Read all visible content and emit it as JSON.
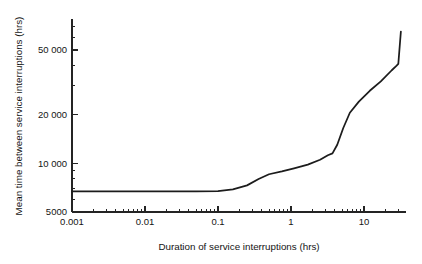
{
  "chart_data": {
    "type": "line",
    "title": "",
    "xlabel": "Duration of service interruptions (hrs)",
    "ylabel": "Mean time between service interruptions (hrs)",
    "xscale": "log",
    "yscale": "log",
    "xlim": [
      0.001,
      35
    ],
    "ylim": [
      5000,
      70000
    ],
    "grid": false,
    "legend": false,
    "xticks": [
      {
        "value": 0.001,
        "label": "0.001"
      },
      {
        "value": 0.01,
        "label": "0.01"
      },
      {
        "value": 0.1,
        "label": "0.1"
      },
      {
        "value": 1,
        "label": "1"
      },
      {
        "value": 10,
        "label": "10"
      }
    ],
    "yticks": [
      {
        "value": 5000,
        "label": "5000"
      },
      {
        "value": 10000,
        "label": "10 000"
      },
      {
        "value": 20000,
        "label": "20 000"
      },
      {
        "value": 50000,
        "label": "50 000"
      }
    ],
    "series": [
      {
        "name": "Mean time between service interruptions",
        "color": "#1c1c1c",
        "x": [
          0.001,
          0.01,
          0.05,
          0.1,
          0.16,
          0.25,
          0.36,
          0.5,
          0.75,
          1.1,
          1.7,
          2.5,
          3.2,
          3.7,
          4.3,
          5.2,
          6.4,
          8.5,
          12,
          17,
          24,
          28,
          29.5,
          32
        ],
        "y": [
          6700,
          6700,
          6700,
          6720,
          6900,
          7300,
          8000,
          8550,
          8900,
          9300,
          9800,
          10500,
          11200,
          11500,
          13000,
          16500,
          20500,
          24000,
          28000,
          32000,
          37500,
          40000,
          41000,
          65000
        ]
      }
    ]
  },
  "axes": {
    "pixel_geometry": {
      "plot_left": 72,
      "plot_right": 406,
      "plot_bottom": 212,
      "plot_top": 19
    }
  }
}
